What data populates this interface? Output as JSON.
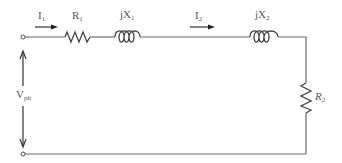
{
  "diagram": {
    "labels": {
      "i1": {
        "main": "I",
        "sub": "1"
      },
      "r1": {
        "main": "R",
        "sub": "1"
      },
      "jx1": {
        "main": "jX",
        "sub": "1"
      },
      "i2": {
        "main": "I",
        "sub": "2"
      },
      "jx2": {
        "main": "jX",
        "sub": "2"
      },
      "r2": {
        "main": "R",
        "sub": "2"
      },
      "vph": {
        "main": "V",
        "sub": "ph"
      }
    },
    "components": [
      {
        "id": "R1",
        "type": "resistor",
        "orientation": "horizontal"
      },
      {
        "id": "jX1",
        "type": "inductor",
        "orientation": "horizontal"
      },
      {
        "id": "jX2",
        "type": "inductor",
        "orientation": "horizontal"
      },
      {
        "id": "R2",
        "type": "resistor",
        "orientation": "vertical"
      }
    ],
    "colors": {
      "wire": "#6a6a6a",
      "component": "#444444",
      "text": "#555555",
      "background": "#ffffff"
    }
  }
}
